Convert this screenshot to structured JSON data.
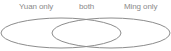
{
  "diagram": {
    "type": "venn",
    "labels": {
      "left": "Yuan only",
      "middle": "both",
      "right": "Ming only"
    },
    "sets": [
      {
        "name": "Yuan",
        "cx": 61,
        "cy": 33,
        "rx": 60,
        "ry": 15
      },
      {
        "name": "Ming",
        "cx": 111,
        "cy": 33,
        "rx": 59,
        "ry": 15
      }
    ],
    "stroke_color": "#8c8c8c"
  }
}
